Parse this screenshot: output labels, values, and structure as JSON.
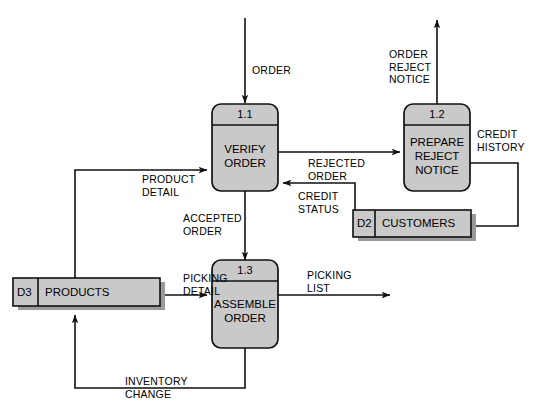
{
  "diagram": {
    "type": "data-flow-diagram",
    "colors": {
      "fill": "#c9c9c9",
      "shadow": "#9a9a9a",
      "stroke": "#111111",
      "background": "#ffffff"
    },
    "processes": [
      {
        "id": "1.1",
        "name_line1": "VERIFY",
        "name_line2": "ORDER"
      },
      {
        "id": "1.2",
        "name_line1": "PREPARE",
        "name_line2": "REJECT",
        "name_line3": "NOTICE"
      },
      {
        "id": "1.3",
        "name_line1": "ASSEMBLE",
        "name_line2": "ORDER"
      }
    ],
    "data_stores": [
      {
        "id": "D2",
        "name": "CUSTOMERS"
      },
      {
        "id": "D3",
        "name": "PRODUCTS"
      }
    ],
    "flows": [
      {
        "name": "order",
        "line1": "ORDER",
        "line2": ""
      },
      {
        "name": "order-reject-notice",
        "line1": "ORDER",
        "line2": "REJECT",
        "line3": "NOTICE"
      },
      {
        "name": "rejected-order",
        "line1": "REJECTED",
        "line2": "ORDER"
      },
      {
        "name": "credit-history",
        "line1": "CREDIT",
        "line2": "HISTORY"
      },
      {
        "name": "credit-status",
        "line1": "CREDIT",
        "line2": "STATUS"
      },
      {
        "name": "product-detail",
        "line1": "PRODUCT",
        "line2": "DETAIL"
      },
      {
        "name": "accepted-order",
        "line1": "ACCEPTED",
        "line2": "ORDER"
      },
      {
        "name": "picking-detail",
        "line1": "PICKING",
        "line2": "DETAIL"
      },
      {
        "name": "picking-list",
        "line1": "PICKING",
        "line2": "LIST"
      },
      {
        "name": "inventory-change",
        "line1": "INVENTORY",
        "line2": "CHANGE"
      }
    ]
  }
}
